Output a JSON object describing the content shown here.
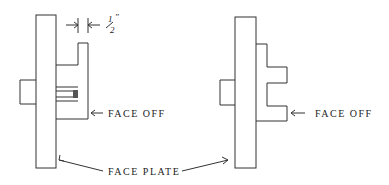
{
  "diagram": {
    "type": "lathe setup sketch",
    "labels": {
      "dimension": "1/2\"",
      "dimension_num": "1",
      "dimension_den": "2",
      "face_off_left": "FACE OFF",
      "face_off_right": "FACE OFF",
      "face_plate": "FACE PLATE"
    },
    "figures": [
      {
        "name": "left-setup",
        "description": "Face plate with workpiece clamped, 1/2 inch wall, face off"
      },
      {
        "name": "right-setup",
        "description": "Face plate with stepped workpiece, face off"
      }
    ],
    "colors": {
      "line": "#333333",
      "background": "#ffffff"
    }
  }
}
